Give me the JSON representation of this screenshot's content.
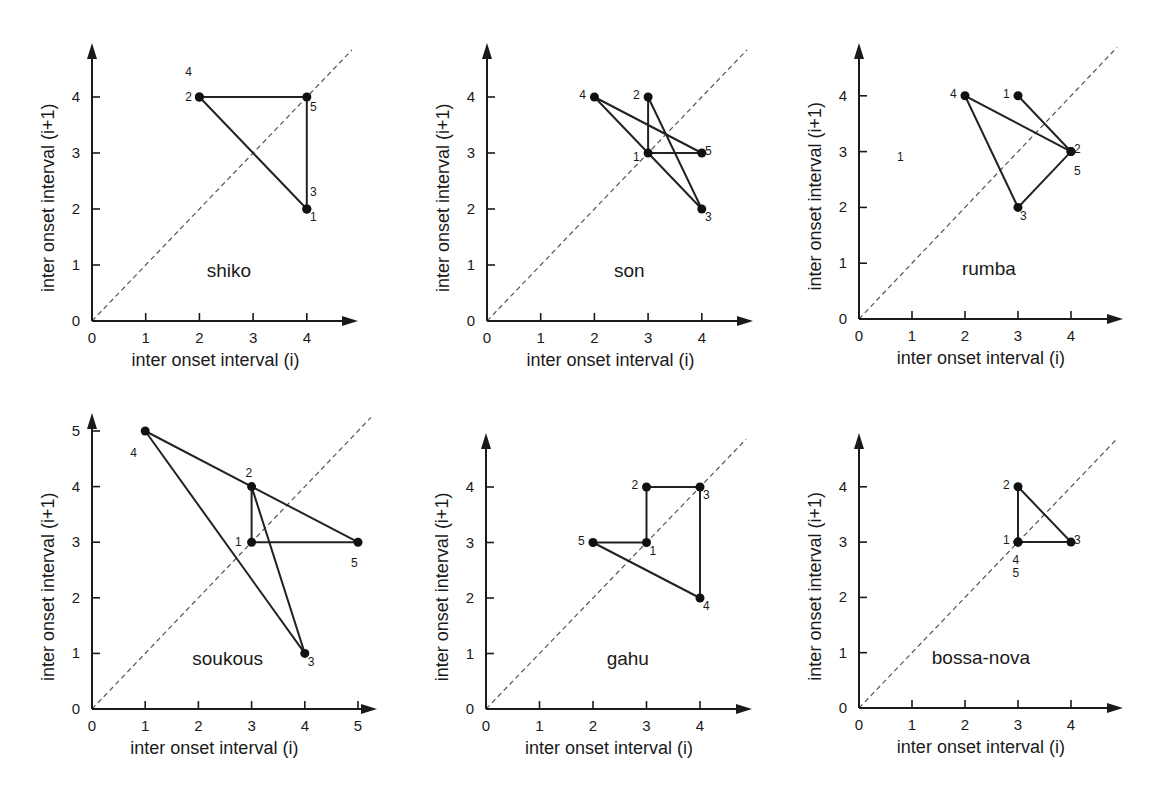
{
  "figure": {
    "xlabel": "inter onset interval (i)",
    "ylabel": "inter onset interval (i+1)",
    "colors": {
      "ink": "#1a1a1a",
      "diagonal": "#555555",
      "background": "#ffffff"
    }
  },
  "chart_data": [
    {
      "type": "line",
      "title": "shiko",
      "xlabel": "inter onset interval (i)",
      "ylabel": "inter onset interval (i+1)",
      "xticks": [
        0,
        1,
        2,
        3,
        4
      ],
      "yticks": [
        0,
        1,
        2,
        3,
        4
      ],
      "xlim": [
        0,
        4.9
      ],
      "ylim": [
        0,
        4.9
      ],
      "diagonal": true,
      "points": [
        {
          "id": 1,
          "x": 4,
          "y": 2
        },
        {
          "id": 2,
          "x": 2,
          "y": 4
        },
        {
          "id": 3,
          "x": 4,
          "y": 2
        },
        {
          "id": 4,
          "x": 2,
          "y": 4
        },
        {
          "id": 5,
          "x": 4,
          "y": 4
        }
      ],
      "path_order": [
        1,
        2,
        3,
        4,
        5,
        1
      ],
      "labels": [
        {
          "text": "4",
          "x": 1.8,
          "y": 4.45
        },
        {
          "text": "2",
          "x": 1.8,
          "y": 4.0
        },
        {
          "text": "5",
          "x": 4.12,
          "y": 3.82
        },
        {
          "text": "3",
          "x": 4.12,
          "y": 2.3
        },
        {
          "text": "1",
          "x": 4.12,
          "y": 1.85
        }
      ],
      "name_pos": {
        "x": 2.55,
        "y": 0.9
      },
      "grid": false,
      "legend": "none"
    },
    {
      "type": "line",
      "title": "son",
      "xlabel": "inter onset interval (i)",
      "ylabel": "inter onset interval (i+1)",
      "xticks": [
        0,
        1,
        2,
        3,
        4
      ],
      "yticks": [
        0,
        1,
        2,
        3,
        4
      ],
      "xlim": [
        0,
        4.9
      ],
      "ylim": [
        0,
        4.9
      ],
      "diagonal": true,
      "points": [
        {
          "id": 1,
          "x": 3,
          "y": 3
        },
        {
          "id": 2,
          "x": 3,
          "y": 4
        },
        {
          "id": 3,
          "x": 4,
          "y": 2
        },
        {
          "id": 4,
          "x": 2,
          "y": 4
        },
        {
          "id": 5,
          "x": 4,
          "y": 3
        }
      ],
      "path_order": [
        1,
        2,
        3,
        4,
        5,
        1
      ],
      "labels": [
        {
          "text": "4",
          "x": 1.78,
          "y": 4.03
        },
        {
          "text": "2",
          "x": 2.78,
          "y": 4.03
        },
        {
          "text": "1",
          "x": 2.78,
          "y": 2.92
        },
        {
          "text": "5",
          "x": 4.12,
          "y": 3.03
        },
        {
          "text": "3",
          "x": 4.12,
          "y": 1.85
        }
      ],
      "name_pos": {
        "x": 2.65,
        "y": 0.9
      },
      "grid": false,
      "legend": "none"
    },
    {
      "type": "line",
      "title": "rumba",
      "xlabel": "inter onset interval (i)",
      "ylabel": "inter onset interval (i+1)",
      "xticks": [
        0,
        1,
        2,
        3,
        4
      ],
      "yticks": [
        0,
        1,
        2,
        3,
        4
      ],
      "xlim": [
        0,
        4.9
      ],
      "ylim": [
        0,
        4.9
      ],
      "diagonal": true,
      "points": [
        {
          "id": 1,
          "x": 3,
          "y": 4
        },
        {
          "id": 2,
          "x": 4,
          "y": 3
        },
        {
          "id": 3,
          "x": 3,
          "y": 2
        },
        {
          "id": 4,
          "x": 2,
          "y": 4
        },
        {
          "id": 5,
          "x": 4,
          "y": 3
        }
      ],
      "path_order": [
        1,
        2,
        3,
        4,
        5
      ],
      "labels": [
        {
          "text": "4",
          "x": 1.78,
          "y": 4.03
        },
        {
          "text": "1",
          "x": 2.78,
          "y": 4.03
        },
        {
          "text": "2",
          "x": 4.12,
          "y": 3.05
        },
        {
          "text": "5",
          "x": 4.12,
          "y": 2.65
        },
        {
          "text": "3",
          "x": 3.1,
          "y": 1.85
        },
        {
          "text": "1",
          "x": 0.78,
          "y": 2.9
        }
      ],
      "name_pos": {
        "x": 2.45,
        "y": 0.9
      },
      "grid": false,
      "legend": "none"
    },
    {
      "type": "line",
      "title": "soukous",
      "xlabel": "inter onset interval (i)",
      "ylabel": "inter onset interval (i+1)",
      "xticks": [
        0,
        1,
        2,
        3,
        4,
        5
      ],
      "yticks": [
        0,
        1,
        2,
        3,
        4,
        5
      ],
      "xlim": [
        0,
        5.3
      ],
      "ylim": [
        0,
        5.2
      ],
      "diagonal": true,
      "points": [
        {
          "id": 1,
          "x": 3,
          "y": 3
        },
        {
          "id": 2,
          "x": 3,
          "y": 4
        },
        {
          "id": 3,
          "x": 4,
          "y": 1
        },
        {
          "id": 4,
          "x": 1,
          "y": 5
        },
        {
          "id": 5,
          "x": 5,
          "y": 3
        }
      ],
      "path_order": [
        1,
        2,
        3,
        4,
        5,
        1
      ],
      "labels": [
        {
          "text": "4",
          "x": 0.78,
          "y": 4.6
        },
        {
          "text": "2",
          "x": 2.95,
          "y": 4.25
        },
        {
          "text": "1",
          "x": 2.75,
          "y": 3.0
        },
        {
          "text": "5",
          "x": 4.93,
          "y": 2.62
        },
        {
          "text": "3",
          "x": 4.12,
          "y": 0.85
        }
      ],
      "name_pos": {
        "x": 2.55,
        "y": 0.9
      },
      "grid": false,
      "legend": "none"
    },
    {
      "type": "line",
      "title": "gahu",
      "xlabel": "inter onset interval (i)",
      "ylabel": "inter onset interval (i+1)",
      "xticks": [
        0,
        1,
        2,
        3,
        4
      ],
      "yticks": [
        0,
        1,
        2,
        3,
        4
      ],
      "xlim": [
        0,
        4.9
      ],
      "ylim": [
        0,
        4.9
      ],
      "diagonal": true,
      "points": [
        {
          "id": 1,
          "x": 3,
          "y": 3
        },
        {
          "id": 2,
          "x": 3,
          "y": 4
        },
        {
          "id": 3,
          "x": 4,
          "y": 4
        },
        {
          "id": 4,
          "x": 4,
          "y": 2
        },
        {
          "id": 5,
          "x": 2,
          "y": 3
        }
      ],
      "path_order": [
        1,
        2,
        3,
        4,
        5,
        1
      ],
      "labels": [
        {
          "text": "2",
          "x": 2.78,
          "y": 4.03
        },
        {
          "text": "3",
          "x": 4.12,
          "y": 3.85
        },
        {
          "text": "5",
          "x": 1.78,
          "y": 3.03
        },
        {
          "text": "1",
          "x": 3.12,
          "y": 2.85
        },
        {
          "text": "4",
          "x": 4.12,
          "y": 1.85
        }
      ],
      "name_pos": {
        "x": 2.65,
        "y": 0.9
      },
      "grid": false,
      "legend": "none"
    },
    {
      "type": "line",
      "title": "bossa-nova",
      "xlabel": "inter onset interval (i)",
      "ylabel": "inter onset interval (i+1)",
      "xticks": [
        0,
        1,
        2,
        3,
        4
      ],
      "yticks": [
        0,
        1,
        2,
        3,
        4
      ],
      "xlim": [
        0,
        4.9
      ],
      "ylim": [
        0,
        4.9
      ],
      "diagonal": true,
      "points": [
        {
          "id": 1,
          "x": 3,
          "y": 3
        },
        {
          "id": 2,
          "x": 3,
          "y": 4
        },
        {
          "id": 3,
          "x": 4,
          "y": 3
        },
        {
          "id": 4,
          "x": 3,
          "y": 3
        },
        {
          "id": 5,
          "x": 3,
          "y": 3
        }
      ],
      "path_order": [
        1,
        2,
        3,
        4,
        5
      ],
      "labels": [
        {
          "text": "2",
          "x": 2.78,
          "y": 4.03
        },
        {
          "text": "1",
          "x": 2.78,
          "y": 3.03
        },
        {
          "text": "3",
          "x": 4.12,
          "y": 3.03
        },
        {
          "text": "4",
          "x": 2.96,
          "y": 2.68
        },
        {
          "text": "5",
          "x": 2.96,
          "y": 2.45
        }
      ],
      "name_pos": {
        "x": 2.3,
        "y": 0.9
      },
      "grid": false,
      "legend": "none"
    }
  ],
  "layout": {
    "panels": [
      {
        "ox": 92,
        "oy": 321,
        "sx": 53.7,
        "sy": 56.0,
        "xend": 358,
        "ytop": 43
      },
      {
        "ox": 487,
        "oy": 321,
        "sx": 53.7,
        "sy": 56.0,
        "xend": 753,
        "ytop": 43
      },
      {
        "ox": 859,
        "oy": 319,
        "sx": 53.0,
        "sy": 55.8,
        "xend": 1123,
        "ytop": 43
      },
      {
        "ox": 92,
        "oy": 709,
        "sx": 53.2,
        "sy": 55.6,
        "xend": 377,
        "ytop": 413
      },
      {
        "ox": 486,
        "oy": 709,
        "sx": 53.5,
        "sy": 55.5,
        "xend": 752,
        "ytop": 433
      },
      {
        "ox": 859,
        "oy": 708,
        "sx": 53.0,
        "sy": 55.3,
        "xend": 1123,
        "ytop": 433
      }
    ]
  }
}
